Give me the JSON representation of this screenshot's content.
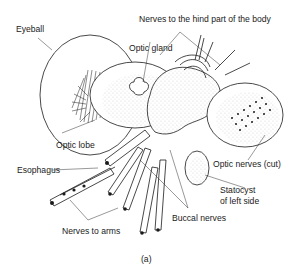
{
  "figure": {
    "caption": "(a)",
    "labels": {
      "eyeball": "Eyeball",
      "nerves_hind": "Nerves to the hind part of the body",
      "optic_gland": "Optic gland",
      "optic_lobe": "Optic lobe",
      "esophagus": "Esophagus",
      "optic_nerves_cut": "Optic nerves (cut)",
      "statocyst_line1": "Statocyst",
      "statocyst_line2": "of left side",
      "buccal_nerves": "Buccal nerves",
      "nerves_to_arms": "Nerves to arms"
    }
  }
}
